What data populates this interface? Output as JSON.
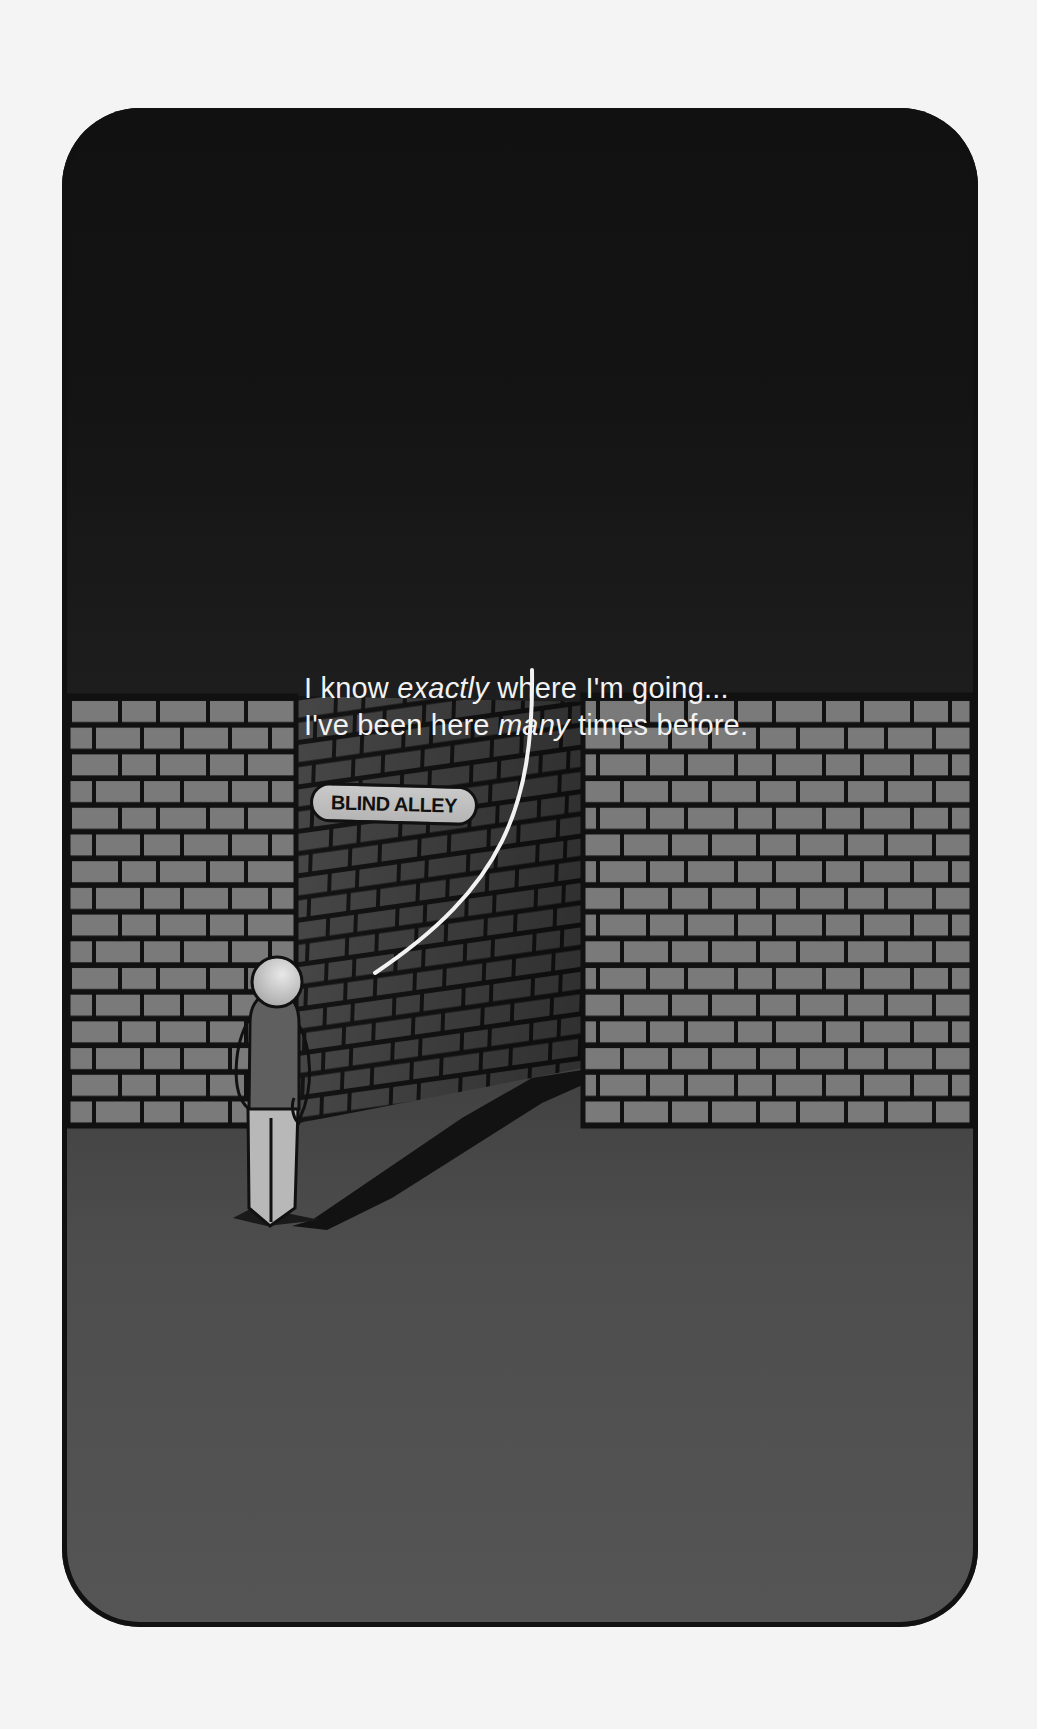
{
  "caption": {
    "line1_pre": "I know ",
    "line1_em": "exactly",
    "line1_post": " where I'm going...",
    "line2_pre": "I've been here ",
    "line2_em": "many",
    "line2_post": " times before."
  },
  "sign": {
    "label": "BLIND ALLEY"
  },
  "colors": {
    "page_background": "#f4f4f4",
    "sky_top": "#111111",
    "ground": "#555555",
    "brick_front": "#7a7a7a",
    "brick_corridor": "#4a4a4a",
    "mortar": "#111111",
    "speech_line": "#f2f2f2",
    "figure_head": "#cfcfcf",
    "figure_torso": "#5f5f5f",
    "figure_legs": "#b8b8b8"
  }
}
